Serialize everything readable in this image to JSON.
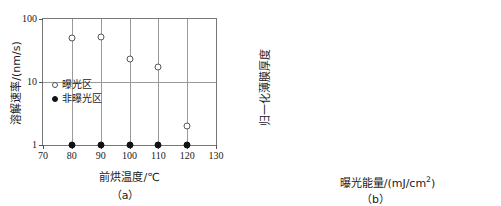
{
  "chart_data": [
    {
      "panel": "(a)",
      "type": "scatter",
      "title": "",
      "xlabel": "前烘温度/℃",
      "ylabel": "溶解速率/(nm/s)",
      "xscale": "linear",
      "yscale": "log",
      "xlim": [
        70,
        130
      ],
      "ylim": [
        1,
        100
      ],
      "xticks": [
        70,
        80,
        90,
        100,
        110,
        120,
        130
      ],
      "xtick_labels": [
        "70",
        "80",
        "90",
        "100",
        "110",
        "120",
        "130"
      ],
      "yticks": [
        1,
        10,
        100
      ],
      "ytick_labels": [
        "1",
        "10",
        "100"
      ],
      "grid": "vertical-at-xticks-and-horizontal-at-yticks",
      "legend_position": "inside-left",
      "series": [
        {
          "name": "曝光区",
          "marker": "open-circle",
          "x": [
            80,
            90,
            100,
            110,
            120
          ],
          "y": [
            50,
            51,
            23,
            17,
            2
          ]
        },
        {
          "name": "非曝光区",
          "marker": "filled-circle",
          "x": [
            80,
            90,
            100,
            110,
            120
          ],
          "y": [
            1,
            1,
            1,
            1,
            1
          ]
        }
      ]
    },
    {
      "panel": "(b)",
      "type": "scatter",
      "title": "",
      "xlabel": "曝光能量/(mJ/cm²)",
      "ylabel": "归一化薄膜厚度",
      "xscale": "log",
      "yscale": "linear",
      "xlim": [
        1,
        1000
      ],
      "ylim": [
        0,
        1
      ],
      "xticks": [
        1,
        10,
        100,
        1000
      ],
      "xtick_labels": [
        "1",
        "10",
        "100",
        "1000"
      ],
      "yticks": [
        0,
        0.1,
        0.2,
        0.3,
        0.4,
        0.5,
        0.6,
        0.7,
        0.8,
        0.9,
        1
      ],
      "ytick_labels": [
        "0",
        "0.1",
        "0.2",
        "0.3",
        "0.4",
        "0.5",
        "0.6",
        "0.7",
        "0.8",
        "0.9",
        "1"
      ],
      "grid": "horizontal-at-yticks-and-vertical-at-decades",
      "legend_position": "none",
      "series": [
        {
          "name": "归一化薄膜厚度",
          "marker": "filled-circle",
          "x": [
            1,
            10,
            20,
            40,
            60,
            80,
            100,
            130,
            160
          ],
          "y": [
            1,
            1,
            1,
            0.93,
            0.85,
            0.75,
            0,
            0,
            0
          ]
        }
      ]
    }
  ],
  "panel_a": {
    "caption": "（a）",
    "xlabel": "前烘温度/℃",
    "ylabel": "溶解速率/(nm/s)",
    "xtick_labels": [
      "70",
      "80",
      "90",
      "100",
      "110",
      "120",
      "130"
    ],
    "ytick_labels": [
      "100",
      "10",
      "1"
    ],
    "legend": [
      {
        "label": "曝光区",
        "marker": "open-circle"
      },
      {
        "label": "非曝光区",
        "marker": "filled-circle"
      }
    ]
  },
  "panel_b": {
    "caption": "（b）",
    "xlabel_main": "曝光能量/(mJ/cm",
    "xlabel_sup": "2",
    "xlabel_tail": ")",
    "ylabel": "归一化薄膜厚度",
    "xtick_labels": [
      "1",
      "10",
      "100",
      "1000"
    ],
    "ytick_labels": [
      "1",
      "0.9",
      "0.8",
      "0.7",
      "0.6",
      "0.5",
      "0.4",
      "0.3",
      "0.2",
      "0.1",
      "0"
    ]
  },
  "colors": {
    "axis": "#777777",
    "grid": "#9a9a9a",
    "marker_filled": "#111111",
    "marker_open_edge": "#555555",
    "background": "#ffffff"
  }
}
